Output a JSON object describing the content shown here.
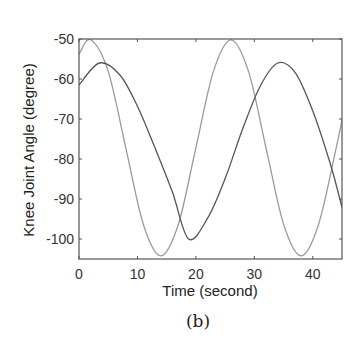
{
  "chart_data": {
    "type": "line",
    "title": "",
    "caption": "(b)",
    "xlabel": "Time (second)",
    "ylabel": "Knee Joint Angle (degree)",
    "xlim": [
      0,
      45
    ],
    "ylim": [
      -105,
      -50
    ],
    "xticks": [
      0,
      10,
      20,
      30,
      40
    ],
    "yticks": [
      -50,
      -60,
      -70,
      -80,
      -90,
      -100
    ],
    "grid": false,
    "legend": null,
    "series": [
      {
        "name": "light-curve",
        "color": "#9a9a9a",
        "x": [
          0,
          2,
          5,
          8,
          11,
          14,
          17,
          20,
          23,
          26,
          29,
          32,
          35,
          38,
          41,
          44,
          45
        ],
        "y": [
          -53.8,
          -50.2,
          -58.1,
          -77.2,
          -96.3,
          -104.2,
          -96.3,
          -77.2,
          -58.1,
          -50.2,
          -58.1,
          -77.2,
          -96.3,
          -104.2,
          -96.3,
          -77.2,
          -70.2
        ]
      },
      {
        "name": "dark-curve",
        "color": "#555555",
        "x": [
          0,
          3.5,
          7,
          10,
          13,
          16,
          18.75,
          22,
          25,
          28,
          31,
          34,
          37,
          40,
          43,
          45
        ],
        "y": [
          -61.5,
          -56.0,
          -59.0,
          -66.8,
          -77.2,
          -88.3,
          -100.0,
          -94.8,
          -84.9,
          -72.5,
          -61.8,
          -56.0,
          -58.4,
          -68.0,
          -81.2,
          -92.1
        ]
      }
    ]
  }
}
